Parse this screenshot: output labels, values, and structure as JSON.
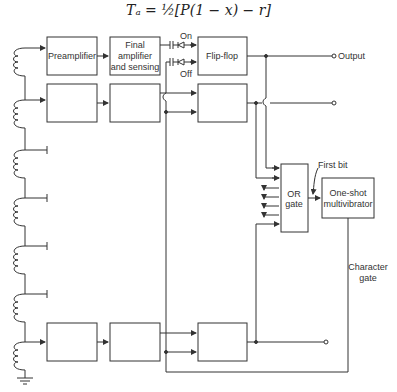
{
  "formula": "Tₐ = ½[P(1 − x) − r]",
  "blocks": {
    "preamplifier": "Preamplifier",
    "final_amp_line1": "Final",
    "final_amp_line2": "amplifier",
    "final_amp_line3": "and sensing",
    "flip_flop": "Flip-flop",
    "or_gate_line1": "OR",
    "or_gate_line2": "gate",
    "one_shot_line1": "One-shot",
    "one_shot_line2": "multivibrator"
  },
  "labels": {
    "on": "On",
    "off": "Off",
    "output": "Output",
    "first_bit": "First bit",
    "character_gate_line1": "Character",
    "character_gate_line2": "gate"
  }
}
